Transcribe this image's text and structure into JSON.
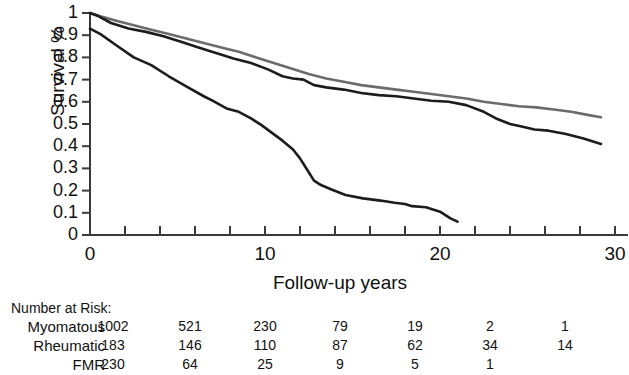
{
  "chart_data": {
    "type": "line",
    "title": "",
    "xlabel": "Follow-up years",
    "ylabel": "Survival %",
    "xlim": [
      0,
      30
    ],
    "ylim": [
      0,
      1
    ],
    "grid": false,
    "legend": "none",
    "x_ticks_major": [
      "0",
      "10",
      "20",
      "30"
    ],
    "x_tick_major_values": [
      0,
      10,
      20,
      30
    ],
    "x_tick_minor_values": [
      2,
      4,
      6,
      8,
      12,
      14,
      16,
      18,
      22,
      24,
      26,
      28
    ],
    "y_ticks": [
      "0",
      "0.1",
      "0.2",
      "0.3",
      "0.4",
      "0.5",
      "0.6",
      "0.7",
      "0.8",
      "0.9",
      "1"
    ],
    "y_tick_values": [
      0,
      0.1,
      0.2,
      0.3,
      0.4,
      0.5,
      0.6,
      0.7,
      0.8,
      0.9,
      1
    ],
    "series": [
      {
        "name": "Rheumatic",
        "color": "#6b6b6b",
        "x": [
          0,
          0.6,
          1.5,
          2.5,
          3.5,
          4.5,
          5.5,
          6.5,
          7.5,
          8.5,
          9.5,
          10.5,
          11.5,
          12.5,
          13.5,
          14.5,
          15.5,
          16.5,
          17.5,
          18.5,
          19.5,
          20.5,
          21.5,
          22.5,
          23.5,
          24.5,
          25.5,
          26.5,
          27.5,
          28.5,
          29.2
        ],
        "y": [
          1.0,
          0.985,
          0.965,
          0.945,
          0.925,
          0.905,
          0.885,
          0.865,
          0.845,
          0.825,
          0.8,
          0.775,
          0.75,
          0.725,
          0.705,
          0.69,
          0.675,
          0.665,
          0.655,
          0.645,
          0.635,
          0.625,
          0.615,
          0.6,
          0.59,
          0.58,
          0.575,
          0.565,
          0.555,
          0.54,
          0.53
        ]
      },
      {
        "name": "Myomatous",
        "color": "#1c1c1c",
        "x": [
          0,
          0.5,
          1.2,
          2.2,
          3.2,
          4.2,
          5.2,
          6.2,
          7.2,
          8.2,
          9.2,
          10.2,
          11.0,
          11.6,
          12.2,
          12.8,
          13.5,
          14.5,
          15.5,
          16.5,
          17.5,
          18.5,
          19.5,
          20.5,
          21.5,
          22.5,
          23.2,
          24.0,
          24.6,
          25.4,
          26.2,
          27.2,
          28.2,
          29.2
        ],
        "y": [
          1.0,
          0.985,
          0.955,
          0.93,
          0.915,
          0.895,
          0.87,
          0.845,
          0.82,
          0.795,
          0.775,
          0.745,
          0.715,
          0.705,
          0.7,
          0.675,
          0.665,
          0.655,
          0.64,
          0.63,
          0.625,
          0.615,
          0.605,
          0.6,
          0.585,
          0.555,
          0.525,
          0.5,
          0.49,
          0.475,
          0.47,
          0.455,
          0.435,
          0.41
        ]
      },
      {
        "name": "FMR",
        "color": "#1c1c1c",
        "x": [
          0,
          0.6,
          1.5,
          2.5,
          3.5,
          4.5,
          5.5,
          6.5,
          7.0,
          7.8,
          8.5,
          9.2,
          9.8,
          10.4,
          11.0,
          11.6,
          12.0,
          12.4,
          12.8,
          13.2,
          13.8,
          14.6,
          15.6,
          16.6,
          17.4,
          18.0,
          18.4,
          19.2,
          20.0,
          20.6,
          21.0
        ],
        "y": [
          0.93,
          0.905,
          0.855,
          0.8,
          0.765,
          0.715,
          0.67,
          0.625,
          0.605,
          0.57,
          0.555,
          0.525,
          0.495,
          0.46,
          0.425,
          0.385,
          0.345,
          0.295,
          0.245,
          0.225,
          0.205,
          0.18,
          0.165,
          0.155,
          0.145,
          0.14,
          0.13,
          0.125,
          0.105,
          0.075,
          0.06
        ]
      }
    ]
  },
  "risk_table": {
    "heading": "Number at Risk:",
    "column_years": [
      0,
      5,
      10,
      15,
      20,
      25,
      30
    ],
    "rows": [
      {
        "label": "Myomatous",
        "values": [
          "1002",
          "521",
          "230",
          "79",
          "19",
          "2",
          "1"
        ]
      },
      {
        "label": "Rheumatic",
        "values": [
          "183",
          "146",
          "110",
          "87",
          "62",
          "34",
          "14"
        ]
      },
      {
        "label": "FMR",
        "values": [
          "230",
          "64",
          "25",
          "9",
          "5",
          "1"
        ]
      }
    ]
  }
}
